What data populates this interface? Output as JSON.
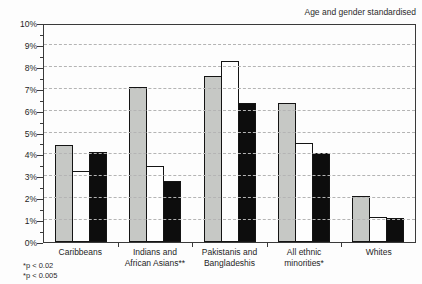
{
  "chart_title": "Age and gender standardised",
  "footnotes": [
    "*p < 0.02",
    "*p < 0.005"
  ],
  "colors": {
    "plot_border": "#3a3a3a",
    "gridline": "#b4b4b4",
    "bar_border": "#141414",
    "legend_shadow": "#1a1a1a"
  },
  "chart_data": {
    "type": "bar",
    "title": "Age and gender standardised",
    "categories": [
      "Caribbeans",
      "Indians and\nAfrican Asians**",
      "Pakistanis and\nBangladeshis",
      "All ethnic minorities*",
      "Whites"
    ],
    "series": [
      {
        "name": "No full-time worker",
        "color": "#c6c8c5",
        "values": [
          4.45,
          7.1,
          7.6,
          6.35,
          2.1
        ]
      },
      {
        "name": "Manual",
        "color": "#fefefe",
        "values": [
          3.25,
          3.45,
          8.25,
          4.5,
          1.15
        ]
      },
      {
        "name": "Non-manual",
        "color": "#0d0d0d",
        "values": [
          4.1,
          2.8,
          6.35,
          4.05,
          1.1
        ]
      }
    ],
    "xlabel": "",
    "ylabel": "",
    "ylim": [
      0,
      10
    ],
    "ytick_step": 1,
    "ytick_suffix": "%",
    "minor_tick_step": 0.5,
    "grid": "horizontal-dashed",
    "legend_position": "top-inside",
    "annotations": [
      "*p < 0.02",
      "*p < 0.005"
    ]
  }
}
